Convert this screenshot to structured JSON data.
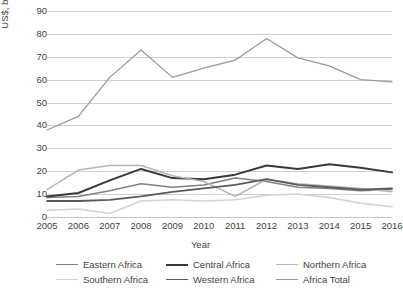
{
  "chart_data": {
    "type": "line",
    "title": "",
    "xlabel": "Year",
    "ylabel": "US$, billions (current prices)",
    "categories": [
      "2005",
      "2006",
      "2007",
      "2008",
      "2009",
      "2010",
      "2011",
      "2012",
      "2013",
      "2014",
      "2015",
      "2016"
    ],
    "x": [
      2005,
      2006,
      2007,
      2008,
      2009,
      2010,
      2011,
      2012,
      2013,
      2014,
      2015,
      2016
    ],
    "ylim": [
      0,
      90
    ],
    "yticks": [
      0,
      10,
      20,
      30,
      40,
      50,
      60,
      70,
      80,
      90
    ],
    "ytick_labels": [
      "0",
      "10",
      "20",
      "30",
      "40",
      "50",
      "60",
      "70",
      "80",
      "90"
    ],
    "grid": true,
    "legend_position": "bottom",
    "series": [
      {
        "name": "Eastern Africa",
        "color": "#808080",
        "width": 1.5,
        "values": [
          8.5,
          9.0,
          11.5,
          14.5,
          13.0,
          14.0,
          17.0,
          15.5,
          13.0,
          12.5,
          11.5,
          12.0
        ]
      },
      {
        "name": "Central Africa",
        "color": "#3a3a3a",
        "width": 2.0,
        "values": [
          9.0,
          10.5,
          16.0,
          21.0,
          17.0,
          16.5,
          18.5,
          22.5,
          21.0,
          23.0,
          21.5,
          19.5
        ]
      },
      {
        "name": "Northern Africa",
        "color": "#b5b5b5",
        "width": 1.5,
        "values": [
          12.0,
          20.5,
          22.5,
          22.5,
          18.0,
          15.5,
          9.0,
          16.5,
          14.5,
          13.5,
          12.5,
          11.0
        ]
      },
      {
        "name": "Southern Africa",
        "color": "#d2d2d2",
        "width": 1.5,
        "values": [
          3.0,
          3.5,
          1.5,
          7.0,
          7.5,
          7.0,
          7.5,
          9.5,
          10.0,
          8.5,
          6.0,
          4.5
        ]
      },
      {
        "name": "Western Africa",
        "color": "#5a5a5a",
        "width": 1.8,
        "values": [
          7.0,
          7.0,
          7.5,
          9.0,
          11.0,
          12.5,
          14.0,
          16.5,
          14.0,
          13.0,
          12.0,
          12.5
        ]
      },
      {
        "name": "Africa Total",
        "color": "#9a9a9a",
        "width": 1.3,
        "values": [
          38.0,
          44.0,
          61.0,
          73.0,
          61.0,
          65.0,
          68.5,
          78.0,
          69.5,
          66.0,
          60.0,
          59.0
        ]
      }
    ]
  }
}
